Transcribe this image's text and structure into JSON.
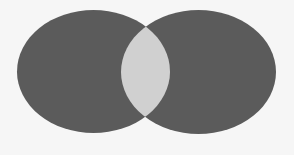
{
  "diagram": {
    "type": "venn",
    "set_count": 2,
    "labels": [],
    "background_color": "#f6f6f6",
    "sets": [
      {
        "id": "left",
        "shape": "ellipse",
        "cx": 93.5,
        "cy": 71.5,
        "rx": 76.5,
        "ry": 61.5,
        "fill": "#5b5b5b"
      },
      {
        "id": "right",
        "shape": "ellipse",
        "cx": 198.5,
        "cy": 72,
        "rx": 77.5,
        "ry": 62,
        "fill": "#5b5b5b"
      }
    ],
    "intersection": {
      "id": "overlap",
      "shape": "lens",
      "fill": "#d0d0d0"
    }
  }
}
